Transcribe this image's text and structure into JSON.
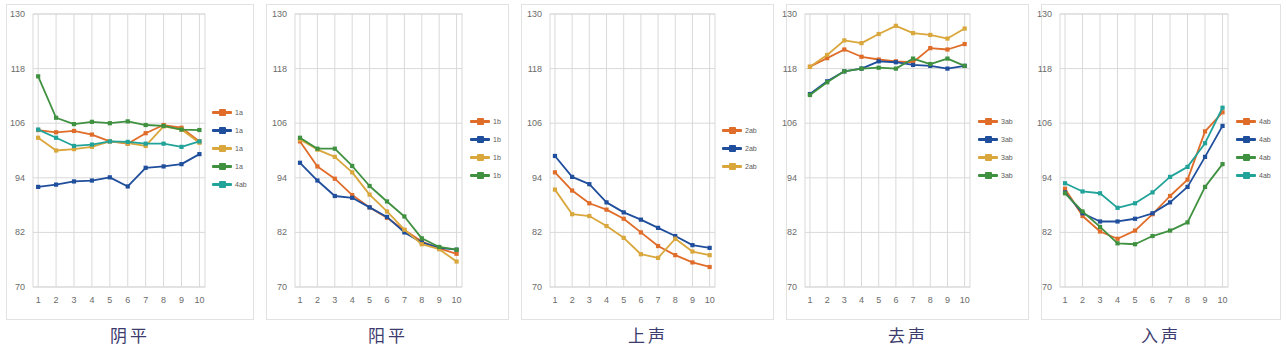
{
  "figure": {
    "panel_count": 5,
    "y_ticks": [
      130,
      118,
      106,
      94,
      82,
      70
    ],
    "x_ticks": [
      1,
      2,
      3,
      4,
      5,
      6,
      7,
      8,
      9,
      10
    ],
    "colors": {
      "orange": "#e06c2a",
      "blue": "#1f4e9c",
      "gold": "#d9a73c",
      "green": "#3f9140",
      "teal": "#22a39a",
      "grid": "#d9d9d9",
      "border": "#e2e2e2",
      "axis_text": "#6b6b6b",
      "caption_text": "#3b3b6d"
    }
  },
  "chart_data": [
    {
      "type": "line",
      "title": "阴平",
      "xlabel": "",
      "ylabel": "",
      "x": [
        1,
        2,
        3,
        4,
        5,
        6,
        7,
        8,
        9,
        10
      ],
      "ylim": [
        70,
        130
      ],
      "yticks": [
        70,
        82,
        94,
        106,
        118,
        130
      ],
      "grid": true,
      "legend_position": "right",
      "series": [
        {
          "name": "1a",
          "color": "#e06c2a",
          "values": [
            104.5,
            104.0,
            104.3,
            103.5,
            102.0,
            101.5,
            103.8,
            105.6,
            105.0,
            102.0
          ]
        },
        {
          "name": "1a",
          "color": "#1f4e9c",
          "values": [
            92.0,
            92.5,
            93.2,
            93.4,
            94.1,
            92.1,
            96.2,
            96.5,
            97.0,
            99.2
          ]
        },
        {
          "name": "1a",
          "color": "#d9a73c",
          "values": [
            102.8,
            100.0,
            100.3,
            100.8,
            102.0,
            101.6,
            101.0,
            105.3,
            104.6,
            101.7
          ]
        },
        {
          "name": "1a",
          "color": "#3f9140",
          "values": [
            116.3,
            107.2,
            105.8,
            106.3,
            106.0,
            106.4,
            105.6,
            105.4,
            104.6,
            104.5
          ]
        },
        {
          "name": "4ab",
          "color": "#22a39a",
          "values": [
            104.6,
            102.8,
            101.0,
            101.3,
            102.0,
            101.9,
            101.5,
            101.5,
            100.8,
            102.0
          ]
        }
      ]
    },
    {
      "type": "line",
      "title": "阳平",
      "xlabel": "",
      "ylabel": "",
      "x": [
        1,
        2,
        3,
        4,
        5,
        6,
        7,
        8,
        9,
        10
      ],
      "ylim": [
        70,
        130
      ],
      "yticks": [
        70,
        82,
        94,
        106,
        118,
        130
      ],
      "grid": true,
      "legend_position": "right",
      "series": [
        {
          "name": "1b",
          "color": "#e06c2a",
          "values": [
            102.0,
            96.5,
            93.8,
            90.2,
            87.5,
            85.2,
            82.5,
            80.0,
            78.5,
            77.3
          ]
        },
        {
          "name": "1b",
          "color": "#1f4e9c",
          "values": [
            97.3,
            93.4,
            90.0,
            89.6,
            87.5,
            85.4,
            82.0,
            79.8,
            78.6,
            78.2
          ]
        },
        {
          "name": "1b",
          "color": "#d9a73c",
          "values": [
            102.4,
            100.2,
            98.6,
            95.2,
            90.3,
            86.6,
            82.6,
            79.4,
            78.3,
            75.6
          ]
        },
        {
          "name": "1b",
          "color": "#3f9140",
          "values": [
            102.8,
            100.4,
            100.4,
            96.6,
            92.2,
            88.8,
            85.5,
            80.7,
            78.8,
            78.2
          ]
        }
      ]
    },
    {
      "type": "line",
      "title": "上声",
      "xlabel": "",
      "ylabel": "",
      "x": [
        1,
        2,
        3,
        4,
        5,
        6,
        7,
        8,
        9,
        10
      ],
      "ylim": [
        70,
        130
      ],
      "yticks": [
        70,
        82,
        94,
        106,
        118,
        130
      ],
      "grid": true,
      "legend_position": "right",
      "series": [
        {
          "name": "2ab",
          "color": "#e06c2a",
          "values": [
            95.2,
            91.2,
            88.4,
            87.0,
            85.0,
            82.0,
            79.0,
            77.0,
            75.4,
            74.4
          ]
        },
        {
          "name": "2ab",
          "color": "#1f4e9c",
          "values": [
            98.8,
            94.2,
            92.6,
            88.6,
            86.4,
            84.8,
            83.0,
            81.2,
            79.2,
            78.6
          ]
        },
        {
          "name": "2ab",
          "color": "#d9a73c",
          "values": [
            91.4,
            86.0,
            85.6,
            83.4,
            80.8,
            77.2,
            76.4,
            80.6,
            77.8,
            77.0
          ]
        }
      ]
    },
    {
      "type": "line",
      "title": "去声",
      "xlabel": "",
      "ylabel": "",
      "x": [
        1,
        2,
        3,
        4,
        5,
        6,
        7,
        8,
        9,
        10
      ],
      "ylim": [
        70,
        130
      ],
      "yticks": [
        70,
        82,
        94,
        106,
        118,
        130
      ],
      "grid": true,
      "legend_position": "right",
      "series": [
        {
          "name": "3ab",
          "color": "#e06c2a",
          "values": [
            118.4,
            120.3,
            122.2,
            120.6,
            120.0,
            119.6,
            119.4,
            122.5,
            122.2,
            123.4
          ]
        },
        {
          "name": "3ab",
          "color": "#1f4e9c",
          "values": [
            112.4,
            115.2,
            117.4,
            118.0,
            119.6,
            119.4,
            118.8,
            118.6,
            118.0,
            118.6
          ]
        },
        {
          "name": "3ab",
          "color": "#d9a73c",
          "values": [
            118.4,
            121.0,
            124.2,
            123.6,
            125.6,
            127.4,
            125.8,
            125.4,
            124.6,
            126.8
          ]
        },
        {
          "name": "3ab",
          "color": "#3f9140",
          "values": [
            112.2,
            115.0,
            117.4,
            118.0,
            118.2,
            118.0,
            120.2,
            119.0,
            120.2,
            118.6
          ]
        }
      ]
    },
    {
      "type": "line",
      "title": "入声",
      "xlabel": "",
      "ylabel": "",
      "x": [
        1,
        2,
        3,
        4,
        5,
        6,
        7,
        8,
        9,
        10
      ],
      "ylim": [
        70,
        130
      ],
      "yticks": [
        70,
        82,
        94,
        106,
        118,
        130
      ],
      "grid": true,
      "legend_position": "right",
      "series": [
        {
          "name": "4ab",
          "color": "#e06c2a",
          "values": [
            91.6,
            85.6,
            82.2,
            80.6,
            82.4,
            86.0,
            90.0,
            93.6,
            104.2,
            108.4
          ]
        },
        {
          "name": "4ab",
          "color": "#1f4e9c",
          "values": [
            90.8,
            86.2,
            84.4,
            84.4,
            85.0,
            86.2,
            88.6,
            92.0,
            98.6,
            105.4
          ]
        },
        {
          "name": "4ab",
          "color": "#3f9140",
          "values": [
            90.6,
            86.6,
            83.2,
            79.6,
            79.4,
            81.2,
            82.4,
            84.2,
            92.0,
            97.0
          ]
        },
        {
          "name": "4ab",
          "color": "#22a39a",
          "values": [
            92.8,
            91.0,
            90.6,
            87.4,
            88.4,
            90.8,
            94.2,
            96.4,
            101.6,
            109.4
          ]
        }
      ]
    }
  ]
}
